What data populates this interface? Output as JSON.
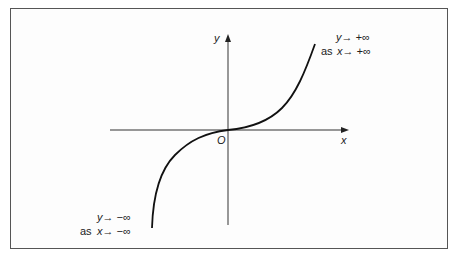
{
  "diagram": {
    "type": "function-graph",
    "axes": {
      "x_label": "x",
      "y_label": "y",
      "origin_label": "O"
    },
    "annotations": {
      "top_right": {
        "line1": "y→ +∞",
        "line2_prefix": "as",
        "line2": "x→ +∞"
      },
      "bottom_left": {
        "line1": "y→ −∞",
        "line2_prefix": "as",
        "line2": "x→ −∞"
      }
    },
    "colors": {
      "curve": "#111111",
      "axes": "#333333",
      "border": "#555555"
    }
  }
}
